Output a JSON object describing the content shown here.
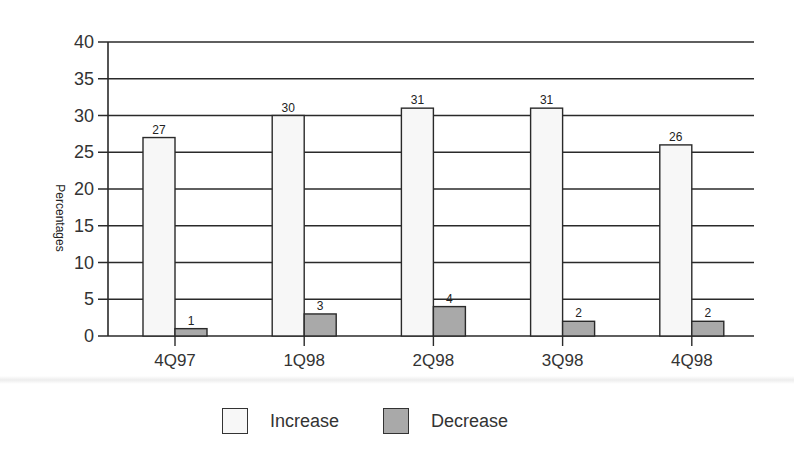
{
  "chart_data": {
    "type": "bar",
    "title": "",
    "xlabel": "",
    "ylabel": "Percentages",
    "ylim": [
      0,
      40
    ],
    "yticks": [
      0,
      5,
      10,
      15,
      20,
      25,
      30,
      35,
      40
    ],
    "grid": true,
    "legend_position": "bottom",
    "categories": [
      "4Q97",
      "1Q98",
      "2Q98",
      "3Q98",
      "4Q98"
    ],
    "series": [
      {
        "name": "Increase",
        "values": [
          27,
          30,
          31,
          31,
          26
        ],
        "color": "#f7f7f7"
      },
      {
        "name": "Decrease",
        "values": [
          1,
          3,
          4,
          2,
          2
        ],
        "color": "#a9a9a9"
      }
    ]
  },
  "legend": {
    "items": [
      {
        "label": "Increase",
        "color": "#f7f7f7"
      },
      {
        "label": "Decrease",
        "color": "#a9a9a9"
      }
    ]
  }
}
